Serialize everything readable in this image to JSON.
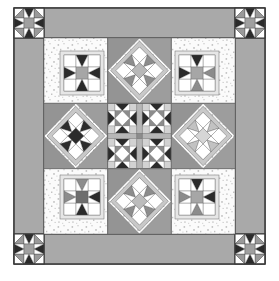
{
  "artwork": {
    "title": "Sampler Star Quilt",
    "type": "quilt-block-diagram",
    "width": 279,
    "height": 281,
    "caption": ""
  },
  "palette": {
    "background": "#ffffff",
    "outline": "#3a3a3a",
    "border_gray": "#a9a9a9",
    "border_gray_dark": "#9d9d9d",
    "speckle_bg": "#fbfbfb",
    "speckle_dot": "#b4b4b4",
    "light_gray": "#d9d9d9",
    "mid_gray": "#a0a0a0",
    "medium_gray": "#8c8c8c",
    "dark_gray": "#4a4a4a",
    "near_black": "#2b2b2b",
    "white": "#ffffff",
    "frame_light": "#e6e6e6",
    "sash_gray": "#9a9a9a"
  },
  "layout": {
    "outer_border": {
      "label": "outer gray border",
      "thickness": 30
    },
    "corner_blocks": {
      "label": "corner star blocks",
      "count": 4,
      "size": 30
    },
    "inner_grid": {
      "label": "3 x 3 block grid",
      "rows": 3,
      "cols": 3
    }
  },
  "blocks": [
    {
      "id": "corner-tl",
      "name": "corner-star-top-left",
      "pattern": "eight-point-star",
      "row": 0,
      "col": 0
    },
    {
      "id": "corner-tr",
      "name": "corner-star-top-right",
      "pattern": "eight-point-star",
      "row": 0,
      "col": 1
    },
    {
      "id": "corner-bl",
      "name": "corner-star-bottom-left",
      "pattern": "eight-point-star",
      "row": 1,
      "col": 0
    },
    {
      "id": "corner-br",
      "name": "corner-star-bottom-right",
      "pattern": "eight-point-star",
      "row": 1,
      "col": 1
    },
    {
      "id": "b-tl",
      "name": "framed-star-top-left",
      "pattern": "framed-eight-point-star",
      "row": 0,
      "col": 0
    },
    {
      "id": "b-tc",
      "name": "on-point-star-top-center",
      "pattern": "on-point-star",
      "row": 0,
      "col": 1
    },
    {
      "id": "b-tr",
      "name": "framed-star-top-right",
      "pattern": "framed-eight-point-star",
      "row": 0,
      "col": 2
    },
    {
      "id": "b-ml",
      "name": "on-point-star-middle-left",
      "pattern": "on-point-star",
      "row": 1,
      "col": 0
    },
    {
      "id": "b-mc",
      "name": "center-medallion",
      "pattern": "four-star-medallion",
      "row": 1,
      "col": 1
    },
    {
      "id": "b-mr",
      "name": "on-point-star-middle-right",
      "pattern": "on-point-star",
      "row": 1,
      "col": 2
    },
    {
      "id": "b-bl",
      "name": "framed-star-bottom-left",
      "pattern": "framed-eight-point-star",
      "row": 2,
      "col": 0
    },
    {
      "id": "b-bc",
      "name": "on-point-star-bottom-center",
      "pattern": "on-point-star",
      "row": 2,
      "col": 1
    },
    {
      "id": "b-br",
      "name": "framed-star-bottom-right",
      "pattern": "framed-eight-point-star",
      "row": 2,
      "col": 2
    }
  ]
}
